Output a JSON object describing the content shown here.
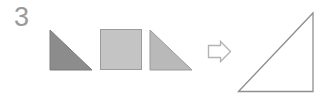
{
  "figure": {
    "index_label": "3",
    "background_color": "#ffffff",
    "description_type": "shape-composition",
    "label_color": "#9a9a9a",
    "operator": {
      "name": "rightwards-arrow",
      "glyph": "⇨",
      "stroke_color": "#b4b4b4",
      "fill_color": "#ffffff"
    },
    "source_shapes": [
      {
        "name": "right-triangle-dark",
        "shape": "right-triangle",
        "right_angle_corner": "bottom-left",
        "fill_color": "#8c8c8c",
        "stroke_color": "#7a7a7a",
        "x": 50,
        "y": 30,
        "width": 42,
        "height": 40
      },
      {
        "name": "square-light",
        "shape": "square",
        "fill_color": "#c4c4c4",
        "stroke_color": "#9b9b9b",
        "x": 100,
        "y": 29,
        "width": 42,
        "height": 41
      },
      {
        "name": "right-triangle-light",
        "shape": "right-triangle",
        "right_angle_corner": "bottom-left",
        "fill_color": "#b9b9b9",
        "stroke_color": "#9b9b9b",
        "x": 150,
        "y": 30,
        "width": 42,
        "height": 40
      }
    ],
    "result_shape": {
      "name": "right-triangle-large-outline",
      "shape": "right-triangle",
      "right_angle_corner": "bottom-right",
      "fill_color": "none",
      "stroke_color": "#8f8f8f",
      "x": 238,
      "y": 13,
      "width": 75,
      "height": 79
    }
  }
}
